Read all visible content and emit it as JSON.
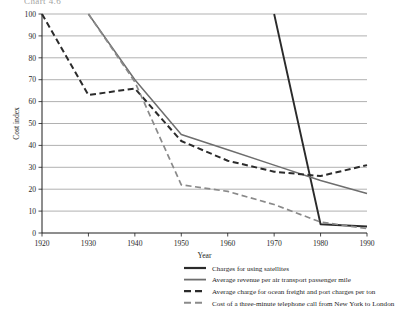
{
  "figure": {
    "cut_title": "Chart 4.6",
    "xlabel": "Year",
    "ylabel": "Cost index"
  },
  "colors": {
    "solid_black": "#2b2b2b",
    "solid_gray": "#6e6e6e",
    "dashed_black": "#2b2b2b",
    "dashed_gray": "#8a8a8a",
    "gridline": "#8f8f8f",
    "axis": "#1d1d1d"
  },
  "axes": {
    "x_ticks": [
      "1920",
      "1930",
      "1940",
      "1950",
      "1960",
      "1970",
      "1980",
      "1990"
    ],
    "y_ticks": [
      "0",
      "10",
      "20",
      "30",
      "40",
      "50",
      "60",
      "70",
      "80",
      "90",
      "100"
    ]
  },
  "legend": {
    "items": [
      {
        "label": "Charges for using satellites",
        "style": "solid-black"
      },
      {
        "label": "Average revenue per air transport passenger mile",
        "style": "solid-gray"
      },
      {
        "label": "Average charge for ocean freight and port charges per ton",
        "style": "dashed-black"
      },
      {
        "label": "Cost of a three-minute telephone call from New York to London",
        "style": "dashed-gray"
      }
    ]
  },
  "chart_data": {
    "type": "line",
    "title": "Chart 4.6",
    "xlabel": "Year",
    "ylabel": "Cost index",
    "xlim": [
      1920,
      1990
    ],
    "ylim": [
      0,
      100
    ],
    "grid": true,
    "legend_position": "below",
    "series": [
      {
        "name": "Charges for using satellites",
        "style": "solid-black",
        "x": [
          1970,
          1980,
          1990
        ],
        "values": [
          100,
          4,
          3
        ]
      },
      {
        "name": "Average revenue per air transport passenger mile",
        "style": "solid-gray",
        "x": [
          1930,
          1940,
          1950,
          1960,
          1970,
          1980,
          1990
        ],
        "values": [
          100,
          70,
          45,
          38,
          31,
          24,
          18
        ]
      },
      {
        "name": "Average charge for ocean freight and port charges per ton",
        "style": "dashed-black",
        "x": [
          1920,
          1930,
          1940,
          1950,
          1960,
          1970,
          1980,
          1990
        ],
        "values": [
          100,
          63,
          66,
          42,
          33,
          28,
          26,
          31
        ]
      },
      {
        "name": "Cost of a three-minute telephone call from New York to London",
        "style": "dashed-gray",
        "x": [
          1930,
          1940,
          1950,
          1960,
          1970,
          1980,
          1990
        ],
        "values": [
          100,
          69,
          22,
          19,
          13,
          5,
          2
        ]
      }
    ]
  }
}
